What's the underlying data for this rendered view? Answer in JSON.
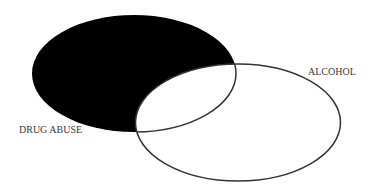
{
  "diagram": {
    "type": "venn",
    "sets": [
      {
        "id": "drug_abuse",
        "label": "DRUG ABUSE",
        "fill": "#000000",
        "shaded": true,
        "shaded_region": "DRUG ABUSE only (excluding overlap with ALCOHOL)"
      },
      {
        "id": "alcohol",
        "label": "ALCOHOL",
        "fill": "#ffffff",
        "shaded": false
      }
    ],
    "overlap": {
      "between": [
        "DRUG ABUSE",
        "ALCOHOL"
      ],
      "fill": "#ffffff"
    },
    "colors": {
      "shade": "#000000",
      "outline": "#333333",
      "label_text": "#3a3a3a",
      "background": "#ffffff"
    }
  }
}
